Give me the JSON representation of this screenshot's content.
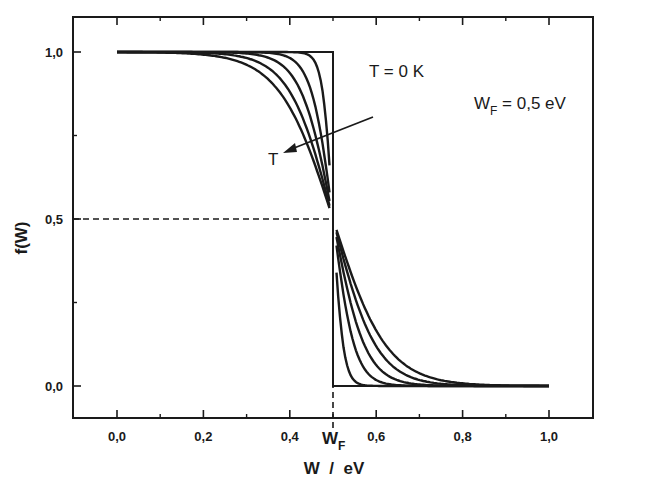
{
  "chart_data": {
    "type": "line",
    "title": "",
    "xlabel": "W / eV",
    "ylabel": "f(W)",
    "xlim": [
      -0.1,
      1.1
    ],
    "ylim": [
      -0.1,
      1.1
    ],
    "grid": false,
    "legend": "none",
    "x_ticks": [
      "0,0",
      "0,2",
      "0,4",
      "0,6",
      "0,8",
      "1,0"
    ],
    "x_tick_values": [
      0.0,
      0.2,
      0.4,
      0.6,
      0.8,
      1.0
    ],
    "x_minor_ticks": [
      0.1,
      0.3,
      0.5,
      0.7,
      0.9
    ],
    "x_special_tick": {
      "label": "W",
      "subscript": "F",
      "value": 0.5
    },
    "y_ticks": [
      "0,0",
      "0,5",
      "1,0"
    ],
    "y_tick_values": [
      0.0,
      0.5,
      1.0
    ],
    "y_minor_ticks": [
      0.25,
      0.75
    ],
    "fermi_energy_eV": 0.5,
    "note": "Temperatures are not labelled in the original figure. The kT values below are illustrative estimates chosen to resemble the drawn curves, not values read from the image.",
    "series": [
      {
        "name": "T = 0 K",
        "kind": "step",
        "x": [
          0.0,
          0.5,
          0.5,
          1.0
        ],
        "y": [
          1.0,
          1.0,
          0.0,
          0.0
        ]
      },
      {
        "name": "T1",
        "kind": "fermi-dirac",
        "kT_eV_estimated": 0.012
      },
      {
        "name": "T2",
        "kind": "fermi-dirac",
        "kT_eV_estimated": 0.025
      },
      {
        "name": "T3",
        "kind": "fermi-dirac",
        "kT_eV_estimated": 0.037
      },
      {
        "name": "T4",
        "kind": "fermi-dirac",
        "kT_eV_estimated": 0.05
      },
      {
        "name": "T5",
        "kind": "fermi-dirac",
        "kT_eV_estimated": 0.062
      }
    ],
    "curve_gap_eV": 0.008,
    "reference_lines": [
      {
        "kind": "horizontal-dashed",
        "y": 0.5,
        "x_from": -0.1,
        "x_to": 0.5
      },
      {
        "kind": "vertical-dashed",
        "x": 0.5,
        "y_from": -0.1,
        "y_to": 0.5
      }
    ],
    "annotations": [
      {
        "text": "T = 0 K",
        "x": 0.53,
        "y": 0.94
      },
      {
        "text": "W",
        "subscript": "F",
        "suffix": " = 0,5 eV",
        "x": 0.82,
        "y": 0.83
      },
      {
        "text": "T",
        "x": 0.43,
        "y": 0.68,
        "arrow": {
          "from": [
            0.59,
            0.81
          ],
          "to": [
            0.46,
            0.7
          ]
        }
      }
    ]
  },
  "labels": {
    "ylabel": "f(W)",
    "xlabel": "W  /  eV",
    "t0": "T = 0 K",
    "wf_main": "W",
    "wf_sub": "F",
    "wf_value": " = 0,5 eV",
    "t_arrow": "T",
    "wf_tick_main": "W",
    "wf_tick_sub": "F"
  },
  "colors": {
    "ink": "#1a1a1a",
    "background": "#ffffff"
  }
}
